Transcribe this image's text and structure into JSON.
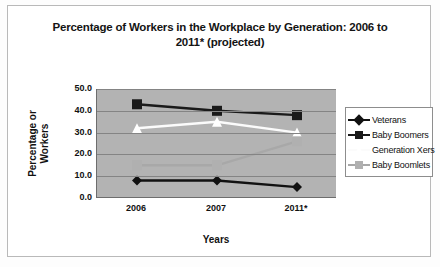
{
  "chart_data": {
    "type": "line",
    "title": "Percentage of Workers in the Workplace by Generation: 2006 to 2011* (projected)",
    "title_line1": "Percentage of Workers in the Workplace by Generation: 2006 to",
    "title_line2": "2011* (projected)",
    "xlabel": "Years",
    "ylabel": "Percentage or Workers",
    "ylabel_line1": "Percentage or",
    "ylabel_line2": "Workers",
    "categories": [
      "2006",
      "2007",
      "2011*"
    ],
    "yticks": [
      "50.0",
      "40.0",
      "30.0",
      "20.0",
      "10.0",
      "0.0"
    ],
    "ylim": [
      0,
      50
    ],
    "ystep": 10,
    "grid": true,
    "legend_position": "right",
    "plot_background": "#b3b3b3",
    "series": [
      {
        "name": "Veterans",
        "values": [
          8.0,
          8.0,
          5.0
        ],
        "color": "#111111",
        "marker": "diamond",
        "marker_color": "#111111"
      },
      {
        "name": "Baby Boomers",
        "values": [
          43.0,
          40.0,
          38.0
        ],
        "color": "#1a1a1a",
        "marker": "square",
        "marker_color": "#1a1a1a"
      },
      {
        "name": "Generation Xers",
        "values": [
          32.0,
          35.0,
          30.0
        ],
        "color": "#fbfbfb",
        "marker": "triangle",
        "marker_color": "#ffffff"
      },
      {
        "name": "Baby Boomlets",
        "values": [
          15.0,
          15.0,
          26.0
        ],
        "color": "#a8a8a8",
        "marker": "square",
        "marker_color": "#b0b0b0"
      }
    ]
  }
}
